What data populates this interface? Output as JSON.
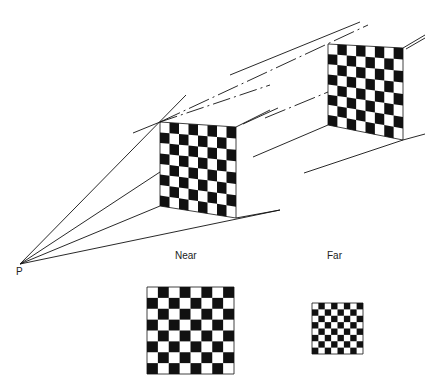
{
  "labels": {
    "point": "P",
    "near": "Near",
    "far": "Far",
    "caption_fragment": "Figure"
  },
  "colors": {
    "ink": "#111111",
    "background": "#ffffff"
  },
  "boards": {
    "near_perspective": {
      "rows": 8,
      "cols": 8,
      "tl": [
        160,
        122
      ],
      "tr": [
        236,
        127
      ],
      "br": [
        236,
        218
      ],
      "bl": [
        160,
        206
      ]
    },
    "far_perspective": {
      "rows": 8,
      "cols": 8,
      "tl": [
        328,
        44
      ],
      "tr": [
        403,
        48
      ],
      "br": [
        403,
        140
      ],
      "bl": [
        328,
        125
      ]
    },
    "near_image": {
      "rows": 8,
      "cols": 8,
      "x": 147,
      "y": 287,
      "size": 87
    },
    "far_image": {
      "rows": 8,
      "cols": 8,
      "x": 312,
      "y": 303,
      "size": 51
    }
  }
}
